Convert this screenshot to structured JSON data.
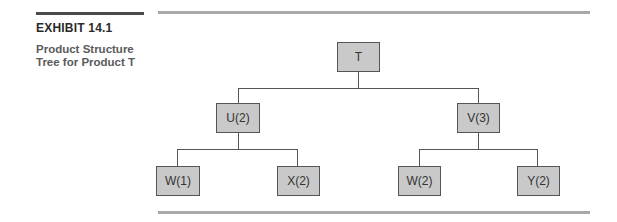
{
  "exhibit": {
    "label": "EXHIBIT 14.1",
    "caption_line1": "Product Structure",
    "caption_line2": "Tree for Product T"
  },
  "tree": {
    "root": {
      "label": "T"
    },
    "level1": [
      {
        "label": "U(2)"
      },
      {
        "label": "V(3)"
      }
    ],
    "level2": [
      {
        "label": "W(1)",
        "parent": "U(2)"
      },
      {
        "label": "X(2)",
        "parent": "U(2)"
      },
      {
        "label": "W(2)",
        "parent": "V(3)"
      },
      {
        "label": "Y(2)",
        "parent": "V(3)"
      }
    ]
  },
  "colors": {
    "node_fill": "#c9c9c9",
    "node_border": "#555555",
    "rule_dark": "#4a4a4a",
    "rule_light": "#a8a8a8"
  }
}
